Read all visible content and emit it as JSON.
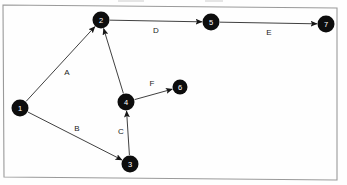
{
  "figure": {
    "title": "",
    "type": "directed-graph",
    "background_color": "#fefefe",
    "node_color": "#0d0d0d",
    "node_label_color": "#ffffff",
    "edge_color": "#2a2a2a",
    "frame_color": "#9a9a9a"
  },
  "graph_data": {
    "type": "diagram",
    "directed": true,
    "nodes": [
      {
        "id": "1",
        "label": "1",
        "x": 20,
        "y": 108,
        "r": 8.5
      },
      {
        "id": "2",
        "label": "2",
        "x": 101,
        "y": 20,
        "r": 8.5
      },
      {
        "id": "3",
        "label": "3",
        "x": 130,
        "y": 164,
        "r": 8.5
      },
      {
        "id": "4",
        "label": "4",
        "x": 126,
        "y": 102,
        "r": 8.5
      },
      {
        "id": "5",
        "label": "5",
        "x": 211,
        "y": 22,
        "r": 8.5
      },
      {
        "id": "6",
        "label": "6",
        "x": 180,
        "y": 87,
        "r": 7.5
      },
      {
        "id": "7",
        "label": "7",
        "x": 326,
        "y": 24,
        "r": 8.5
      }
    ],
    "edges": [
      {
        "id": "edge-a",
        "from": "1",
        "to": "2",
        "label": "A",
        "label_x": 67,
        "label_y": 72
      },
      {
        "id": "edge-b",
        "from": "1",
        "to": "3",
        "label": "B",
        "label_x": 77,
        "label_y": 128
      },
      {
        "id": "edge-c",
        "from": "3",
        "to": "4",
        "label": "C",
        "label_x": 121,
        "label_y": 131
      },
      {
        "id": "edge-4-2",
        "from": "4",
        "to": "2",
        "label": "",
        "label_x": 0,
        "label_y": 0
      },
      {
        "id": "edge-d",
        "from": "2",
        "to": "5",
        "label": "D",
        "label_x": 156,
        "label_y": 30
      },
      {
        "id": "edge-e",
        "from": "5",
        "to": "7",
        "label": "E",
        "label_x": 269,
        "label_y": 32
      },
      {
        "id": "edge-f",
        "from": "4",
        "to": "6",
        "label": "F",
        "label_x": 152,
        "label_y": 83
      }
    ]
  },
  "frame": {
    "top_left_x": 3,
    "top_left_y": 5,
    "top_right_x": 337,
    "top_right_y": 8,
    "bottom_right_x": 337,
    "bottom_right_y": 180,
    "bottom_left_x": 4,
    "bottom_left_y": 177
  }
}
